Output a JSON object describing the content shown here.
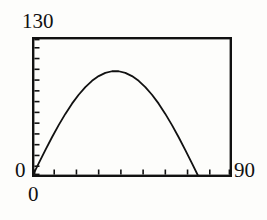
{
  "figure": {
    "background_color": "#fdfdfb",
    "ink_color": "#111111"
  },
  "labels": {
    "y_max": "130",
    "y_origin": "0",
    "x_origin": "0",
    "x_max": "90"
  },
  "chart_data": {
    "type": "line",
    "title": "",
    "subtitle": "",
    "xlabel": "",
    "ylabel": "",
    "xlim": [
      0,
      90
    ],
    "ylim": [
      0,
      130
    ],
    "grid": false,
    "legend": null,
    "axis_style": "box-frame-with-inward-ticks",
    "x_tick_values": [
      0,
      10,
      20,
      30,
      40,
      50,
      60,
      70,
      80,
      90
    ],
    "x_tick_labels": [
      "0",
      "",
      "",
      "",
      "",
      "",
      "",
      "",
      "",
      "90"
    ],
    "y_tick_values": [
      0,
      10,
      20,
      30,
      40,
      50,
      60,
      70,
      80,
      90,
      100,
      110,
      120,
      130
    ],
    "y_tick_labels": [
      "0",
      "",
      "",
      "",
      "",
      "",
      "",
      "",
      "",
      "",
      "",
      "",
      "",
      "130"
    ],
    "line_color": "#111111",
    "line_width": 1.8,
    "series": [
      {
        "name": "",
        "x": [
          0,
          3,
          6,
          9,
          12,
          15,
          18,
          21,
          24,
          27,
          30,
          33,
          36,
          39,
          42,
          45,
          48,
          51,
          54,
          57,
          60,
          63,
          66,
          69,
          72,
          75,
          78,
          81,
          84,
          87,
          90
        ],
        "y": [
          0,
          12.6,
          25.0,
          36.9,
          48.2,
          58.6,
          68.1,
          76.4,
          83.5,
          89.3,
          93.7,
          96.7,
          98.2,
          98.2,
          96.7,
          93.7,
          89.3,
          83.5,
          76.4,
          68.1,
          58.6,
          48.2,
          36.9,
          25.0,
          12.6,
          0,
          0,
          0,
          0,
          0,
          0
        ]
      }
    ]
  }
}
